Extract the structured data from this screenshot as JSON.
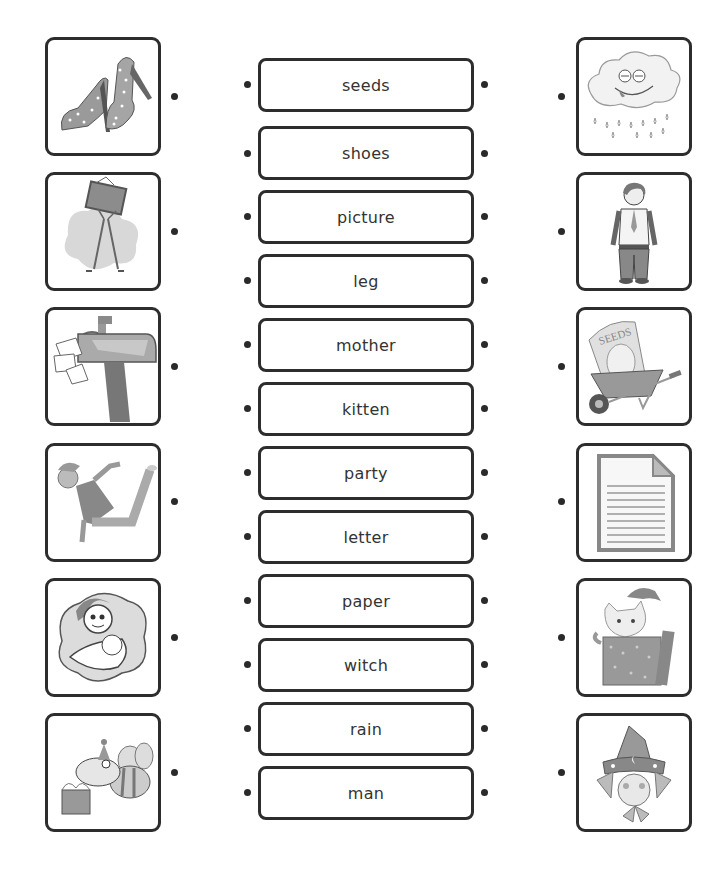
{
  "worksheet": {
    "left_pictures": [
      {
        "name": "shoes",
        "icon": "high-heel-shoes-icon"
      },
      {
        "name": "picture",
        "icon": "person-holding-picture-icon"
      },
      {
        "name": "letter",
        "icon": "mailbox-letters-icon"
      },
      {
        "name": "leg",
        "icon": "dancing-boy-leg-icon"
      },
      {
        "name": "mother",
        "icon": "mother-with-baby-icon"
      },
      {
        "name": "party",
        "icon": "party-bee-icon"
      }
    ],
    "words": [
      {
        "label": "seeds"
      },
      {
        "label": "shoes"
      },
      {
        "label": "picture"
      },
      {
        "label": "leg"
      },
      {
        "label": "mother"
      },
      {
        "label": "kitten"
      },
      {
        "label": "party"
      },
      {
        "label": "letter"
      },
      {
        "label": "paper"
      },
      {
        "label": "witch"
      },
      {
        "label": "rain"
      },
      {
        "label": "man"
      }
    ],
    "right_pictures": [
      {
        "name": "rain",
        "icon": "rain-cloud-icon"
      },
      {
        "name": "man",
        "icon": "standing-man-icon"
      },
      {
        "name": "seeds",
        "icon": "wheelbarrow-seeds-icon",
        "text": "SEEDS"
      },
      {
        "name": "paper",
        "icon": "lined-paper-icon"
      },
      {
        "name": "kitten",
        "icon": "kitten-in-box-icon"
      },
      {
        "name": "witch",
        "icon": "witch-hat-icon"
      }
    ]
  }
}
